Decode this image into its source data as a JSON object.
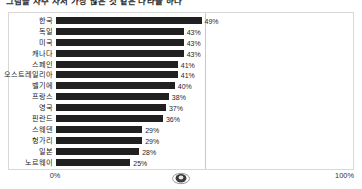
{
  "title": "그림을 자주 사서 가장 많은 것 같은 나라들 하나",
  "axis": {
    "min_label": "0%",
    "max_label": "100%"
  },
  "watermark": {
    "name": "oval-watermark"
  },
  "chart_data": {
    "type": "bar",
    "orientation": "horizontal",
    "title": "그림을 자주 사서 가장 많은 것 같은 나라들 하나",
    "xlabel": "",
    "ylabel": "",
    "xlim": [
      0,
      100
    ],
    "grid": true,
    "gridlines": [
      50
    ],
    "legend": "none",
    "value_suffix": "%",
    "bar_color": "#202020",
    "frame_color": "#d8d8d8",
    "categories": [
      "한국",
      "독일",
      "미국",
      "캐나다",
      "스페인",
      "오스트레일리아",
      "벨기에",
      "프랑스",
      "영국",
      "핀란드",
      "스웨덴",
      "헝가리",
      "일본",
      "노르웨이"
    ],
    "values": [
      49,
      43,
      43,
      43,
      41,
      41,
      40,
      38,
      37,
      36,
      29,
      29,
      28,
      25
    ],
    "value_labels": [
      "49%",
      "43%",
      "43%",
      "43%",
      "41%",
      "41%",
      "40%",
      "38%",
      "37%",
      "36%",
      "29%",
      "29%",
      "28%",
      "25%"
    ]
  }
}
